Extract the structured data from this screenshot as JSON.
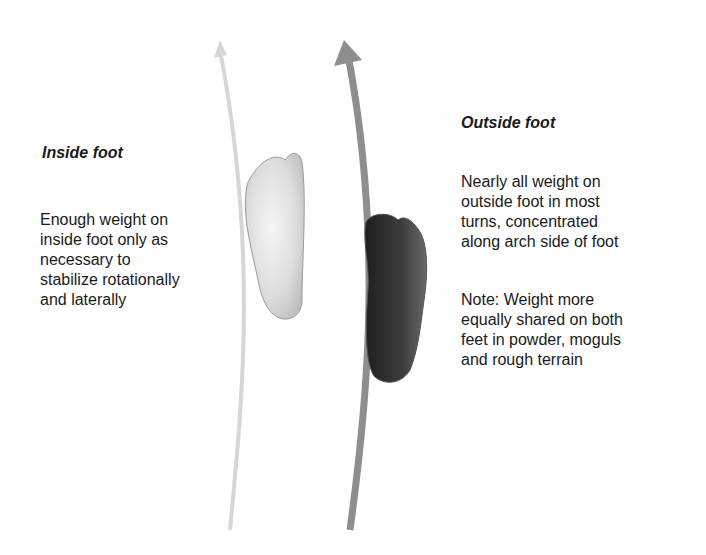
{
  "inside": {
    "title": "Inside foot",
    "text": "Enough weight on\ninside foot only as\nnecessary to\nstabilize rotationally\nand laterally"
  },
  "outside": {
    "title": "Outside foot",
    "text": "Nearly all weight on\noutside foot in most\nturns, concentrated\nalong arch side of foot",
    "note": "Note:  Weight more\nequally shared on both\nfeet in powder, moguls\nand rough terrain"
  },
  "colors": {
    "inside_arrow": "#d4d4d4",
    "outside_arrow": "#8c8c8c",
    "inside_foot": "#e2e2e2",
    "outside_foot": "#3a3a3a"
  }
}
